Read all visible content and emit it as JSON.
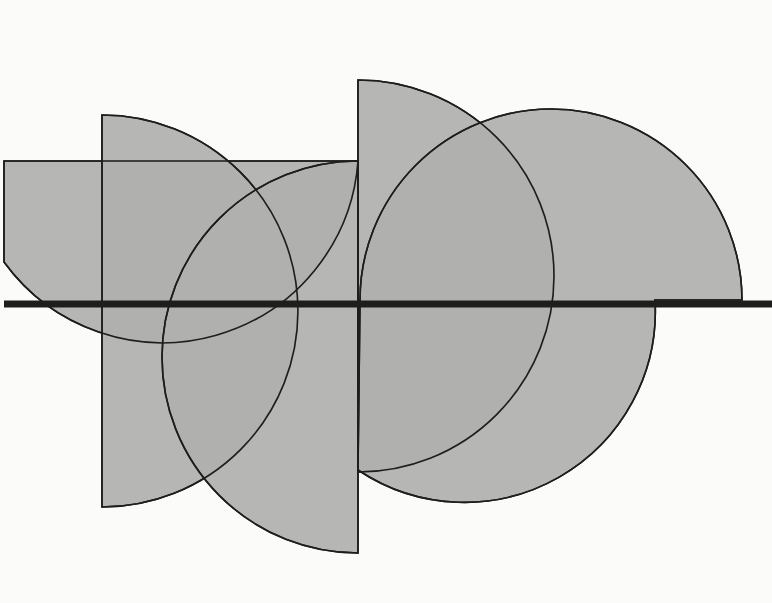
{
  "artwork": {
    "background": "#fbfbf9",
    "fill": "#b0b0ae",
    "stroke": "#1e1e1e",
    "shapes": [
      {
        "name": "shape-bowl-left",
        "d": "M4 161 L358 161 A196 196 0 0 1 4 262 Z"
      },
      {
        "name": "shape-quarter-b",
        "d": "M102 115 A196 196 0 0 1 102 507 Z"
      },
      {
        "name": "shape-half-c",
        "d": "M358 161 A196 196 0 0 0 358 553 Z"
      },
      {
        "name": "shape-half-d",
        "d": "M358 80 A196 196 0 0 1 358 472 Z"
      },
      {
        "name": "shape-circle-e",
        "d": "M360 300 A191 191 0 0 1 742 300 L655 300 A191 191 0 0 1 358 470 Z"
      }
    ],
    "baseline": {
      "x1": 4,
      "x2": 772,
      "y": 304,
      "width": 7
    }
  }
}
